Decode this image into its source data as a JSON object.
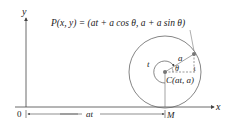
{
  "diagram": {
    "title_formula": "P(x, y) = (at + a cos θ, a + a sin θ)",
    "axes": {
      "x_label": "x",
      "y_label": "y",
      "origin_label": "0"
    },
    "labels": {
      "radius": "a",
      "angle": "θ",
      "arc_param": "t",
      "center": "C(at, a)",
      "contact_point": "M",
      "distance": "at",
      "vertical_offset": "1"
    },
    "colors": {
      "line": "#555555",
      "circle": "#666666",
      "point": "#777777",
      "text": "#222222"
    }
  }
}
